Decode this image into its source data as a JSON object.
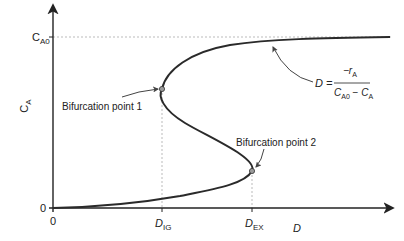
{
  "axes": {
    "y_label_main": "C",
    "y_label_sub": "A",
    "y_tick_top_main": "C",
    "y_tick_top_sub": "A0",
    "y_tick_zero": "0",
    "x_tick_zero": "0",
    "x_tick_ig_main": "D",
    "x_tick_ig_sub": "IG",
    "x_tick_ex_main": "D",
    "x_tick_ex_sub": "EX",
    "x_label": "D"
  },
  "annotations": {
    "bifurcation_1": "Bifurcation point 1",
    "bifurcation_2": "Bifurcation point 2",
    "equation": {
      "lhs": "D =",
      "numerator_main": "−r",
      "numerator_sub": "A",
      "denominator_a_main": "C",
      "denominator_a_sub": "A0",
      "denominator_minus": " − ",
      "denominator_b_main": "C",
      "denominator_b_sub": "A"
    }
  },
  "colors": {
    "curve": "#2a2a2a",
    "guide": "#999999",
    "point_fill": "#9a9a9a"
  }
}
